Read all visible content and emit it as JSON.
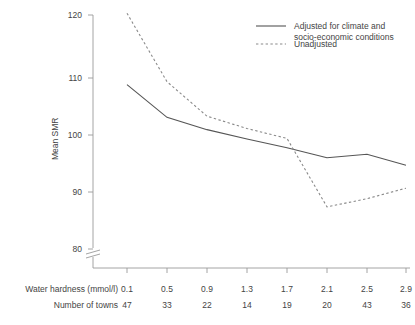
{
  "chart_data": {
    "type": "line",
    "title": "",
    "xlabel": "Water hardness (mmol/l)",
    "ylabel": "Mean SMR",
    "x": [
      0.1,
      0.5,
      0.9,
      1.3,
      1.7,
      2.1,
      2.5,
      2.9
    ],
    "xtick_labels": [
      "0.1",
      "0.5",
      "0.9",
      "1.3",
      "1.7",
      "2.1",
      "2.5",
      "2.9"
    ],
    "ytick_labels": [
      "80",
      "90",
      "100",
      "110",
      "120"
    ],
    "ytick_values": [
      80,
      90,
      100,
      110,
      120
    ],
    "ylim": [
      80,
      120
    ],
    "y_axis_break": true,
    "grid": false,
    "legend_position": "top-right",
    "series": [
      {
        "name": "Adjusted for climate and socio-economic conditions",
        "style": "solid",
        "color": "#555555",
        "values": [
          108.1,
          102.5,
          100.4,
          98.8,
          97.3,
          95.6,
          96.2,
          94.3
        ]
      },
      {
        "name": "Unadjusted",
        "style": "dotted",
        "color": "#888888",
        "values": [
          120.3,
          108.6,
          102.7,
          100.6,
          98.9,
          87.2,
          88.6,
          90.4
        ]
      }
    ],
    "annotation_rows": [
      {
        "label": "Water hardness (mmol/l)",
        "values": [
          "0.1",
          "0.5",
          "0.9",
          "1.3",
          "1.7",
          "2.1",
          "2.5",
          "2.9"
        ]
      },
      {
        "label": "Number of towns",
        "values": [
          "47",
          "33",
          "22",
          "14",
          "19",
          "20",
          "43",
          "36"
        ]
      }
    ]
  },
  "legend": {
    "entries": [
      {
        "line1": "Adjusted for climate and",
        "line2": "socio-economic conditions",
        "style": "solid"
      },
      {
        "line1": "Unadjusted",
        "line2": "",
        "style": "dotted"
      }
    ]
  },
  "axis": {
    "y_title": "Mean SMR",
    "y_ticks": [
      "120",
      "110",
      "100",
      "90",
      "80"
    ]
  }
}
